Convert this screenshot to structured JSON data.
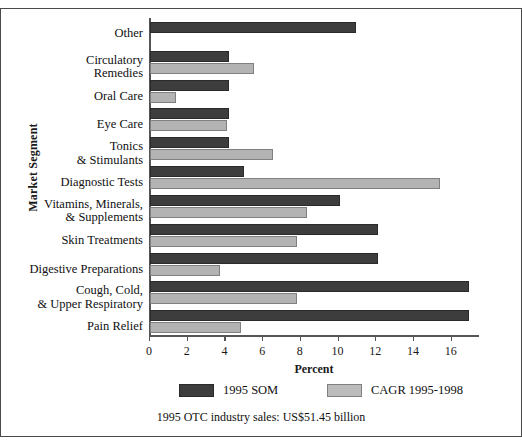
{
  "chart_data": {
    "type": "bar",
    "orientation": "horizontal",
    "title": "",
    "xlabel": "Percent",
    "ylabel": "Market Segment",
    "xlim": [
      0,
      17.5
    ],
    "xticks": [
      0,
      2,
      4,
      6,
      8,
      10,
      12,
      14,
      16
    ],
    "grid": false,
    "legend_position": "bottom",
    "categories": [
      "Other",
      "Circulatory\nRemedies",
      "Oral Care",
      "Eye Care",
      "Tonics\n& Stimulants",
      "Diagnostic Tests",
      "Vitamins, Minerals,\n& Supplements",
      "Skin Treatments",
      "Digestive Preparations",
      "Cough, Cold,\n& Upper Respiratory",
      "Pain Relief"
    ],
    "series": [
      {
        "name": "1995 SOM",
        "color": "#3d3d3d",
        "values": [
          10.9,
          4.2,
          4.2,
          4.2,
          4.2,
          5.0,
          10.1,
          12.1,
          12.1,
          16.9,
          16.9
        ]
      },
      {
        "name": "CAGR 1995-1998",
        "color": "#b3b3b3",
        "values": [
          null,
          5.5,
          1.4,
          4.1,
          6.5,
          15.4,
          8.3,
          7.8,
          3.7,
          7.8,
          4.8
        ]
      }
    ],
    "footnote": "1995 OTC industry sales: US$51.45 billion"
  },
  "legend": {
    "entries": [
      {
        "label": "1995 SOM",
        "swatch": "som"
      },
      {
        "label": "CAGR 1995-1998",
        "swatch": "cagr"
      }
    ]
  },
  "colors": {
    "som": "#3d3d3d",
    "cagr": "#b3b3b3",
    "axis": "#555555",
    "text": "#101010",
    "frame": "#4a4a4a"
  }
}
